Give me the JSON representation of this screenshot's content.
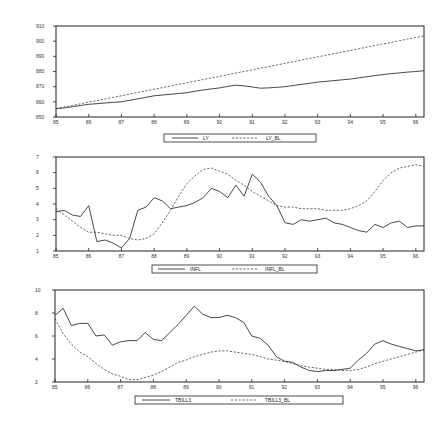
{
  "chart_data": [
    {
      "type": "line",
      "title": "",
      "xlabel": "",
      "ylabel": "",
      "x_tick_labels": [
        "85",
        "86",
        "87",
        "88",
        "89",
        "90",
        "91",
        "92",
        "93",
        "94",
        "95",
        "96"
      ],
      "y_tick_labels": [
        "850",
        "860",
        "870",
        "880",
        "890",
        "900",
        "910"
      ],
      "xlim": [
        1985,
        1996.25
      ],
      "ylim": [
        850,
        910
      ],
      "grid": false,
      "legend_position": "bottom",
      "legend": [
        "LY",
        "LY_BL"
      ],
      "x": [
        1985.0,
        1985.25,
        1985.5,
        1985.75,
        1986.0,
        1986.25,
        1986.5,
        1986.75,
        1987.0,
        1987.25,
        1987.5,
        1987.75,
        1988.0,
        1988.25,
        1988.5,
        1988.75,
        1989.0,
        1989.25,
        1989.5,
        1989.75,
        1990.0,
        1990.25,
        1990.5,
        1990.75,
        1991.0,
        1991.25,
        1991.5,
        1991.75,
        1992.0,
        1992.25,
        1992.5,
        1992.75,
        1993.0,
        1993.25,
        1993.5,
        1993.75,
        1994.0,
        1994.25,
        1994.5,
        1994.75,
        1995.0,
        1995.25,
        1995.5,
        1995.75,
        1996.0,
        1996.25
      ],
      "series": [
        {
          "name": "LY",
          "style": "solid",
          "values": [
            855.5,
            856.0,
            856.8,
            857.6,
            858.4,
            858.8,
            859.2,
            859.6,
            860.0,
            861.0,
            862.0,
            863.0,
            864.0,
            864.5,
            865.0,
            865.5,
            866.0,
            867.0,
            867.8,
            868.5,
            869.2,
            870.2,
            871.0,
            870.5,
            869.8,
            869.0,
            869.2,
            869.6,
            870.0,
            870.8,
            871.5,
            872.2,
            873.0,
            873.5,
            874.0,
            874.5,
            875.0,
            875.8,
            876.6,
            877.3,
            878.0,
            878.6,
            879.1,
            879.6,
            880.0,
            880.5
          ]
        },
        {
          "name": "LY_BL",
          "style": "dashed",
          "values": [
            855.5,
            856.6,
            857.6,
            858.7,
            859.8,
            860.8,
            861.9,
            863.0,
            864.0,
            865.1,
            866.2,
            867.2,
            868.3,
            869.4,
            870.4,
            871.5,
            872.6,
            873.6,
            874.7,
            875.8,
            876.8,
            877.9,
            879.0,
            880.0,
            881.1,
            882.2,
            883.2,
            884.3,
            885.4,
            886.4,
            887.5,
            888.6,
            889.6,
            890.7,
            891.8,
            892.8,
            893.9,
            895.0,
            896.0,
            897.1,
            898.2,
            899.2,
            900.3,
            901.4,
            902.4,
            903.5
          ]
        }
      ]
    },
    {
      "type": "line",
      "title": "",
      "xlabel": "",
      "ylabel": "",
      "x_tick_labels": [
        "85",
        "86",
        "87",
        "88",
        "89",
        "90",
        "91",
        "92",
        "93",
        "94",
        "95",
        "96"
      ],
      "y_tick_labels": [
        "1",
        "2",
        "3",
        "4",
        "5",
        "6",
        "7"
      ],
      "xlim": [
        1985,
        1996.25
      ],
      "ylim": [
        1,
        7
      ],
      "grid": false,
      "legend_position": "bottom",
      "legend": [
        "INFL",
        "INFL_BL"
      ],
      "x": [
        1985.0,
        1985.25,
        1985.5,
        1985.75,
        1986.0,
        1986.25,
        1986.5,
        1986.75,
        1987.0,
        1987.25,
        1987.5,
        1987.75,
        1988.0,
        1988.25,
        1988.5,
        1988.75,
        1989.0,
        1989.25,
        1989.5,
        1989.75,
        1990.0,
        1990.25,
        1990.5,
        1990.75,
        1991.0,
        1991.25,
        1991.5,
        1991.75,
        1992.0,
        1992.25,
        1992.5,
        1992.75,
        1993.0,
        1993.25,
        1993.5,
        1993.75,
        1994.0,
        1994.25,
        1994.5,
        1994.75,
        1995.0,
        1995.25,
        1995.5,
        1995.75,
        1996.0,
        1996.25
      ],
      "series": [
        {
          "name": "INFL",
          "style": "solid",
          "values": [
            3.5,
            3.6,
            3.3,
            3.2,
            3.9,
            1.6,
            1.7,
            1.5,
            1.2,
            1.8,
            3.6,
            3.8,
            4.4,
            4.2,
            3.7,
            3.8,
            3.9,
            4.1,
            4.4,
            5.0,
            4.8,
            4.4,
            5.2,
            4.5,
            5.9,
            5.4,
            4.5,
            3.9,
            2.8,
            2.7,
            3.0,
            2.9,
            3.0,
            3.1,
            2.8,
            2.7,
            2.5,
            2.3,
            2.2,
            2.7,
            2.5,
            2.8,
            2.9,
            2.5,
            2.6,
            2.6
          ]
        },
        {
          "name": "INFL_BL",
          "style": "dashed",
          "values": [
            3.7,
            3.3,
            2.9,
            2.5,
            2.2,
            2.2,
            2.1,
            2.0,
            2.0,
            1.8,
            1.7,
            1.8,
            2.1,
            2.8,
            3.6,
            4.5,
            5.3,
            5.8,
            6.2,
            6.3,
            6.1,
            5.9,
            5.5,
            5.2,
            4.8,
            4.5,
            4.2,
            3.9,
            3.8,
            3.8,
            3.7,
            3.7,
            3.7,
            3.6,
            3.6,
            3.6,
            3.7,
            3.9,
            4.2,
            4.8,
            5.5,
            6.0,
            6.3,
            6.4,
            6.5,
            6.4
          ]
        }
      ]
    },
    {
      "type": "line",
      "title": "",
      "xlabel": "",
      "ylabel": "",
      "x_tick_labels": [
        "85",
        "86",
        "87",
        "88",
        "89",
        "90",
        "91",
        "92",
        "93",
        "94",
        "95",
        "96"
      ],
      "y_tick_labels": [
        "2",
        "4",
        "6",
        "8",
        "10"
      ],
      "xlim": [
        1985,
        1996.25
      ],
      "ylim": [
        2,
        10
      ],
      "grid": false,
      "legend_position": "bottom",
      "legend": [
        "TBILL3",
        "TBILL3_BL"
      ],
      "x": [
        1985.0,
        1985.25,
        1985.5,
        1985.75,
        1986.0,
        1986.25,
        1986.5,
        1986.75,
        1987.0,
        1987.25,
        1987.5,
        1987.75,
        1988.0,
        1988.25,
        1988.5,
        1988.75,
        1989.0,
        1989.25,
        1989.5,
        1989.75,
        1990.0,
        1990.25,
        1990.5,
        1990.75,
        1991.0,
        1991.25,
        1991.5,
        1991.75,
        1992.0,
        1992.25,
        1992.5,
        1992.75,
        1993.0,
        1993.25,
        1993.5,
        1993.75,
        1994.0,
        1994.25,
        1994.5,
        1994.75,
        1995.0,
        1995.25,
        1995.5,
        1995.75,
        1996.0,
        1996.25
      ],
      "series": [
        {
          "name": "TBILL3",
          "style": "solid",
          "values": [
            7.8,
            8.4,
            6.9,
            7.1,
            7.1,
            6.0,
            6.1,
            5.2,
            5.5,
            5.6,
            5.6,
            6.3,
            5.7,
            5.6,
            6.3,
            7.0,
            7.8,
            8.6,
            7.9,
            7.6,
            7.6,
            7.8,
            7.6,
            7.2,
            6.0,
            5.8,
            5.2,
            4.2,
            3.8,
            3.7,
            3.3,
            3.0,
            2.9,
            3.0,
            3.0,
            3.1,
            3.2,
            3.9,
            4.5,
            5.3,
            5.6,
            5.3,
            5.1,
            4.9,
            4.7,
            4.8
          ]
        },
        {
          "name": "TBILL3_BL",
          "style": "dashed",
          "values": [
            7.5,
            6.2,
            5.3,
            4.6,
            4.2,
            3.6,
            3.1,
            2.7,
            2.5,
            2.2,
            2.2,
            2.4,
            2.6,
            2.9,
            3.3,
            3.7,
            3.9,
            4.2,
            4.4,
            4.6,
            4.7,
            4.7,
            4.6,
            4.5,
            4.4,
            4.2,
            4.0,
            3.9,
            3.8,
            3.6,
            3.4,
            3.3,
            3.2,
            3.1,
            3.1,
            3.0,
            3.0,
            3.1,
            3.3,
            3.6,
            3.8,
            4.0,
            4.2,
            4.4,
            4.6,
            4.8
          ]
        }
      ]
    }
  ],
  "legends": {
    "ly": {
      "solid": "LY",
      "dashed": "LY_BL"
    },
    "infl": {
      "solid": "INFL",
      "dashed": "INFL_BL"
    },
    "tbill": {
      "solid": "TBILL3",
      "dashed": "TBILL3_BL"
    }
  }
}
